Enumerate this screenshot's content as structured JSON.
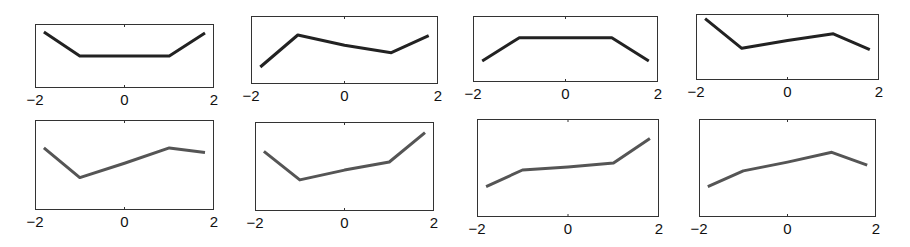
{
  "chart_data": [
    {
      "type": "line",
      "title": "",
      "xlabel": "",
      "ylabel": "",
      "x": [
        -1.8,
        -1,
        0,
        1,
        1.8
      ],
      "values": [
        0.875,
        0.5,
        0.5,
        0.5,
        0.86
      ],
      "xlim": [
        -2,
        2
      ],
      "ylim": [
        0,
        1
      ],
      "xticks": [
        "-2",
        "0",
        "2"
      ],
      "grid": false,
      "color": "#222222",
      "box": {
        "left": 35,
        "top": 24,
        "width": 179,
        "height": 64
      }
    },
    {
      "type": "line",
      "title": "",
      "xlabel": "",
      "ylabel": "",
      "x": [
        -1.8,
        -1,
        0,
        1,
        1.8
      ],
      "values": [
        0.25,
        0.72,
        0.57,
        0.46,
        0.71
      ],
      "xlim": [
        -2,
        2
      ],
      "ylim": [
        0,
        1
      ],
      "xticks": [
        "-2",
        "0",
        "2"
      ],
      "grid": false,
      "color": "#222222",
      "box": {
        "left": 251,
        "top": 16,
        "width": 187,
        "height": 68
      }
    },
    {
      "type": "line",
      "title": "",
      "xlabel": "",
      "ylabel": "",
      "x": [
        -1.8,
        -1,
        0,
        1,
        1.8
      ],
      "values": [
        0.32,
        0.67,
        0.67,
        0.67,
        0.32
      ],
      "xlim": [
        -2,
        2
      ],
      "ylim": [
        0,
        1
      ],
      "xticks": [
        "-2",
        "0",
        "2"
      ],
      "grid": false,
      "color": "#222222",
      "box": {
        "left": 473,
        "top": 16,
        "width": 185,
        "height": 66
      }
    },
    {
      "type": "line",
      "title": "",
      "xlabel": "",
      "ylabel": "",
      "x": [
        -1.8,
        -1,
        0,
        1,
        1.8
      ],
      "values": [
        0.93,
        0.48,
        0.6,
        0.7,
        0.46
      ],
      "xlim": [
        -2,
        2
      ],
      "ylim": [
        0,
        1
      ],
      "xticks": [
        "-2",
        "0",
        "2"
      ],
      "grid": false,
      "color": "#222222",
      "box": {
        "left": 696,
        "top": 14,
        "width": 183,
        "height": 66
      }
    },
    {
      "type": "line",
      "title": "",
      "xlabel": "",
      "ylabel": "",
      "x": [
        -1.8,
        -1,
        0,
        1,
        1.8
      ],
      "values": [
        0.69,
        0.36,
        0.52,
        0.69,
        0.64
      ],
      "xlim": [
        -2,
        2
      ],
      "ylim": [
        0,
        1
      ],
      "xticks": [
        "-2",
        "0",
        "2"
      ],
      "grid": false,
      "color": "#555555",
      "box": {
        "left": 35,
        "top": 120,
        "width": 179,
        "height": 90
      }
    },
    {
      "type": "line",
      "title": "",
      "xlabel": "",
      "ylabel": "",
      "x": [
        -1.8,
        -1,
        0,
        1,
        1.8
      ],
      "values": [
        0.67,
        0.35,
        0.46,
        0.55,
        0.88
      ],
      "xlim": [
        -2,
        2
      ],
      "ylim": [
        0,
        1
      ],
      "xticks": [
        "-2",
        "0",
        "2"
      ],
      "grid": false,
      "color": "#555555",
      "box": {
        "left": 255,
        "top": 122,
        "width": 179,
        "height": 89
      }
    },
    {
      "type": "line",
      "title": "",
      "xlabel": "",
      "ylabel": "",
      "x": [
        -1.8,
        -1,
        0,
        1,
        1.8
      ],
      "values": [
        0.31,
        0.48,
        0.51,
        0.55,
        0.8
      ],
      "xlim": [
        -2,
        2
      ],
      "ylim": [
        0,
        1
      ],
      "xticks": [
        "-2",
        "0",
        "2"
      ],
      "grid": false,
      "color": "#555555",
      "box": {
        "left": 477,
        "top": 119,
        "width": 182,
        "height": 98
      }
    },
    {
      "type": "line",
      "title": "",
      "xlabel": "",
      "ylabel": "",
      "x": [
        -1.8,
        -1,
        0,
        1,
        1.8
      ],
      "values": [
        0.31,
        0.47,
        0.56,
        0.66,
        0.53
      ],
      "xlim": [
        -2,
        2
      ],
      "ylim": [
        0,
        1
      ],
      "xticks": [
        "-2",
        "0",
        "2"
      ],
      "grid": false,
      "color": "#555555",
      "box": {
        "left": 699,
        "top": 119,
        "width": 177,
        "height": 98
      }
    }
  ]
}
